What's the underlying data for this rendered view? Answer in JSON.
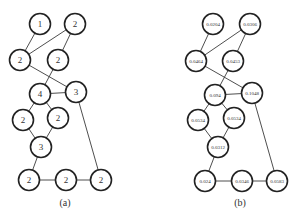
{
  "figure": {
    "panels": [
      {
        "id": "a",
        "caption": "(a)",
        "caption_pos": [
          65,
          206
        ],
        "label_class": "lbl-a",
        "nodes": [
          {
            "id": "n1",
            "x": 40,
            "y": 24,
            "label": "1"
          },
          {
            "id": "n2",
            "x": 75,
            "y": 24,
            "label": "2"
          },
          {
            "id": "n3",
            "x": 20,
            "y": 60,
            "label": "2"
          },
          {
            "id": "n4",
            "x": 58,
            "y": 60,
            "label": "2"
          },
          {
            "id": "n5",
            "x": 40,
            "y": 94,
            "label": "4"
          },
          {
            "id": "n6",
            "x": 76,
            "y": 92,
            "label": "3"
          },
          {
            "id": "n7",
            "x": 23,
            "y": 120,
            "label": "2"
          },
          {
            "id": "n8",
            "x": 58,
            "y": 118,
            "label": "2"
          },
          {
            "id": "n9",
            "x": 41,
            "y": 147,
            "label": "3"
          },
          {
            "id": "n10",
            "x": 29,
            "y": 180,
            "label": "2"
          },
          {
            "id": "n11",
            "x": 66,
            "y": 180,
            "label": "2"
          },
          {
            "id": "n12",
            "x": 101,
            "y": 180,
            "label": "2"
          }
        ]
      },
      {
        "id": "b",
        "caption": "(b)",
        "caption_pos": [
          240,
          206
        ],
        "label_class": "lbl-b",
        "nodes": [
          {
            "id": "n1",
            "x": 213,
            "y": 24,
            "label": "0.0204"
          },
          {
            "id": "n2",
            "x": 250,
            "y": 24,
            "label": "0.0306"
          },
          {
            "id": "n3",
            "x": 196,
            "y": 61,
            "label": "0.0464"
          },
          {
            "id": "n4",
            "x": 233,
            "y": 61,
            "label": "0.0453"
          },
          {
            "id": "n5",
            "x": 215,
            "y": 95,
            "label": "0.094"
          },
          {
            "id": "n6",
            "x": 252,
            "y": 93,
            "label": "0.1048"
          },
          {
            "id": "n7",
            "x": 198,
            "y": 120,
            "label": "0.0534"
          },
          {
            "id": "n8",
            "x": 234,
            "y": 118,
            "label": "0.0534"
          },
          {
            "id": "n9",
            "x": 218,
            "y": 147,
            "label": "0.0312"
          },
          {
            "id": "n10",
            "x": 205,
            "y": 181,
            "label": "0.024"
          },
          {
            "id": "n11",
            "x": 242,
            "y": 181,
            "label": "0.0346"
          },
          {
            "id": "n12",
            "x": 277,
            "y": 181,
            "label": "0.0583"
          }
        ]
      }
    ],
    "edges": [
      [
        "n1",
        "n3"
      ],
      [
        "n2",
        "n3"
      ],
      [
        "n2",
        "n4"
      ],
      [
        "n3",
        "n6"
      ],
      [
        "n4",
        "n5"
      ],
      [
        "n5",
        "n6"
      ],
      [
        "n5",
        "n7"
      ],
      [
        "n5",
        "n8"
      ],
      [
        "n7",
        "n9"
      ],
      [
        "n8",
        "n9"
      ],
      [
        "n9",
        "n10"
      ],
      [
        "n10",
        "n11"
      ],
      [
        "n11",
        "n12"
      ],
      [
        "n6",
        "n12"
      ]
    ],
    "node_radius": 10.5,
    "colors": {
      "stroke": "#222222",
      "edge": "#3a3a3a",
      "text": "#333333",
      "background": "#ffffff"
    }
  }
}
